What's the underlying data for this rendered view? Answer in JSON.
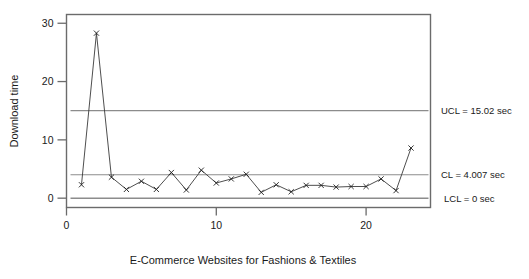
{
  "chart_data": {
    "type": "line",
    "title": "",
    "subtitle": "",
    "xlabel": "E-Commerce Websites for Fashions & Textiles",
    "ylabel": "Download time",
    "xlim": [
      0,
      24.3
    ],
    "ylim": [
      -1.6,
      31.5
    ],
    "xticks": [
      0,
      10,
      20
    ],
    "xticklabels": [
      "0",
      "10",
      "20"
    ],
    "yticks": [
      0,
      10,
      20,
      30
    ],
    "yticklabels": [
      "0",
      "10",
      "20",
      "30"
    ],
    "grid": false,
    "legend_position": "none",
    "marker": "x",
    "series": [
      {
        "name": "Download time",
        "x": [
          1,
          2,
          3,
          4,
          5,
          6,
          7,
          8,
          9,
          10,
          11,
          12,
          13,
          14,
          15,
          16,
          17,
          18,
          19,
          20,
          21,
          22,
          23
        ],
        "values": [
          2.3,
          28.3,
          3.6,
          1.5,
          2.9,
          1.5,
          4.4,
          1.4,
          4.8,
          2.6,
          3.3,
          4.1,
          1.0,
          2.3,
          1.1,
          2.2,
          2.2,
          1.9,
          2.0,
          2.0,
          3.3,
          1.3,
          8.6
        ]
      }
    ],
    "reference_lines": [
      {
        "name": "UCL",
        "value": 15.02,
        "label": "UCL = 15.02 sec"
      },
      {
        "name": "CL",
        "value": 4.007,
        "label": "CL = 4.007 sec"
      },
      {
        "name": "LCL",
        "value": 0,
        "label": "LCL = 0 sec"
      }
    ],
    "colors": {
      "line": "#3a3a3a",
      "marker": "#1f1f1f",
      "reference_line": "#8c8c8c",
      "axis": "#6b6b6b",
      "text": "#1a1a1a",
      "background": "#ffffff"
    }
  }
}
